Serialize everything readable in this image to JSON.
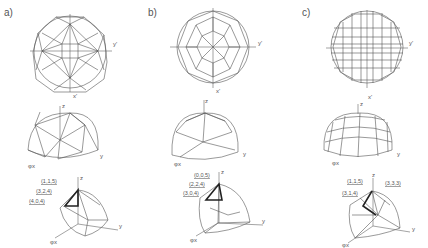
{
  "panels": [
    {
      "label": "a)",
      "axes": {
        "y": "y'",
        "x": "x'",
        "z": "z",
        "y3d": "y",
        "x3d": "φx"
      },
      "coords": [
        "(1,1,5)",
        "(3,2,4)",
        "(4,0,4)"
      ]
    },
    {
      "label": "b)",
      "axes": {
        "y": "y'",
        "x": "x'",
        "z": "z",
        "y3d": "y",
        "x3d": "φx"
      },
      "coords": [
        "(0,0,5)",
        "(2,2,4)",
        "(3,0,4)"
      ]
    },
    {
      "label": "c)",
      "axes": {
        "y": "y'",
        "x": "x'",
        "z": "z",
        "y3d": "y",
        "x3d": "φx"
      },
      "coords": [
        "(1,1,5)",
        "(3,1,4)",
        "(3,3,3)"
      ]
    }
  ]
}
